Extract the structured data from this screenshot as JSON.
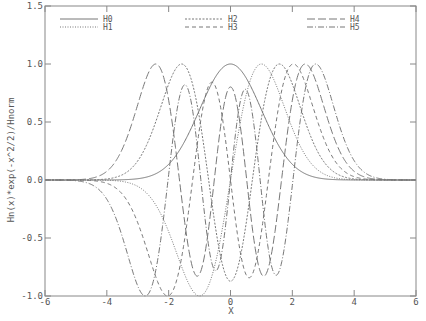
{
  "chart_data": {
    "type": "line",
    "title": "",
    "xlabel": "X",
    "ylabel": "Hn(x)*exp(-x^2/2)/Hnorm",
    "xlim": [
      -6,
      6
    ],
    "ylim": [
      -1.0,
      1.5
    ],
    "x_ticks": [
      "-6",
      "-4",
      "-2",
      "0",
      "2",
      "4",
      "6"
    ],
    "y_ticks": [
      "1.5",
      "1.0",
      "0.5",
      "0.0",
      "-0.5",
      "-1.0"
    ],
    "grid": false,
    "legend_position": "top inside, 3 columns",
    "series": [
      {
        "name": "H0",
        "n": 0,
        "style": "solid",
        "peaks": [
          {
            "x": 0.0,
            "y": 1.0
          }
        ]
      },
      {
        "name": "H1",
        "n": 1,
        "style": "dotted",
        "peaks": [
          {
            "x": -1.0,
            "y": -1.0
          },
          {
            "x": 1.0,
            "y": 1.0
          }
        ]
      },
      {
        "name": "H2",
        "n": 2,
        "style": "short-dash",
        "peaks": [
          {
            "x": -1.73,
            "y": 1.0
          },
          {
            "x": 0.0,
            "y": -0.5
          },
          {
            "x": 1.73,
            "y": 1.0
          }
        ]
      },
      {
        "name": "H3",
        "n": 3,
        "style": "dash",
        "peaks": [
          {
            "x": -2.12,
            "y": -1.0
          },
          {
            "x": -0.6,
            "y": 0.8
          },
          {
            "x": 0.6,
            "y": -0.8
          },
          {
            "x": 2.12,
            "y": 1.0
          }
        ]
      },
      {
        "name": "H4",
        "n": 4,
        "style": "long-dash",
        "peaks": [
          {
            "x": -2.45,
            "y": 1.0
          },
          {
            "x": -1.1,
            "y": -0.6
          },
          {
            "x": 0.0,
            "y": 0.55
          },
          {
            "x": 1.1,
            "y": -0.6
          },
          {
            "x": 2.45,
            "y": 1.0
          }
        ]
      },
      {
        "name": "H5",
        "n": 5,
        "style": "dash-dot",
        "peaks": [
          {
            "x": -2.75,
            "y": -1.0
          },
          {
            "x": -1.5,
            "y": 0.8
          },
          {
            "x": -0.5,
            "y": -0.6
          },
          {
            "x": 0.5,
            "y": 0.6
          },
          {
            "x": 1.5,
            "y": -0.8
          },
          {
            "x": 2.75,
            "y": 1.0
          }
        ]
      }
    ]
  },
  "legend": {
    "items": [
      {
        "label": "H0"
      },
      {
        "label": "H1"
      },
      {
        "label": "H2"
      },
      {
        "label": "H3"
      },
      {
        "label": "H4"
      },
      {
        "label": "H5"
      }
    ]
  },
  "axes": {
    "xlabel": "X",
    "ylabel": "Hn(x)*exp(-x^2/2)/Hnorm",
    "x_ticks": [
      "-6",
      "-4",
      "-2",
      "0",
      "2",
      "4",
      "6"
    ],
    "y_ticks": [
      "1.5",
      "1.0",
      "0.5",
      "0.0",
      "-0.5",
      "-1.0"
    ]
  }
}
